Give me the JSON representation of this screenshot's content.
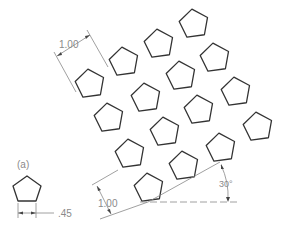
{
  "figure": {
    "label_a": "(a)",
    "pentagon_size_label": ".45",
    "spacing_label_top": "1.00",
    "spacing_label_left": "1.00",
    "angle_label": "30°"
  },
  "colors": {
    "pentagon_stroke": "#333333",
    "dimension_stroke": "#888888",
    "text": "#8a8a8a"
  }
}
